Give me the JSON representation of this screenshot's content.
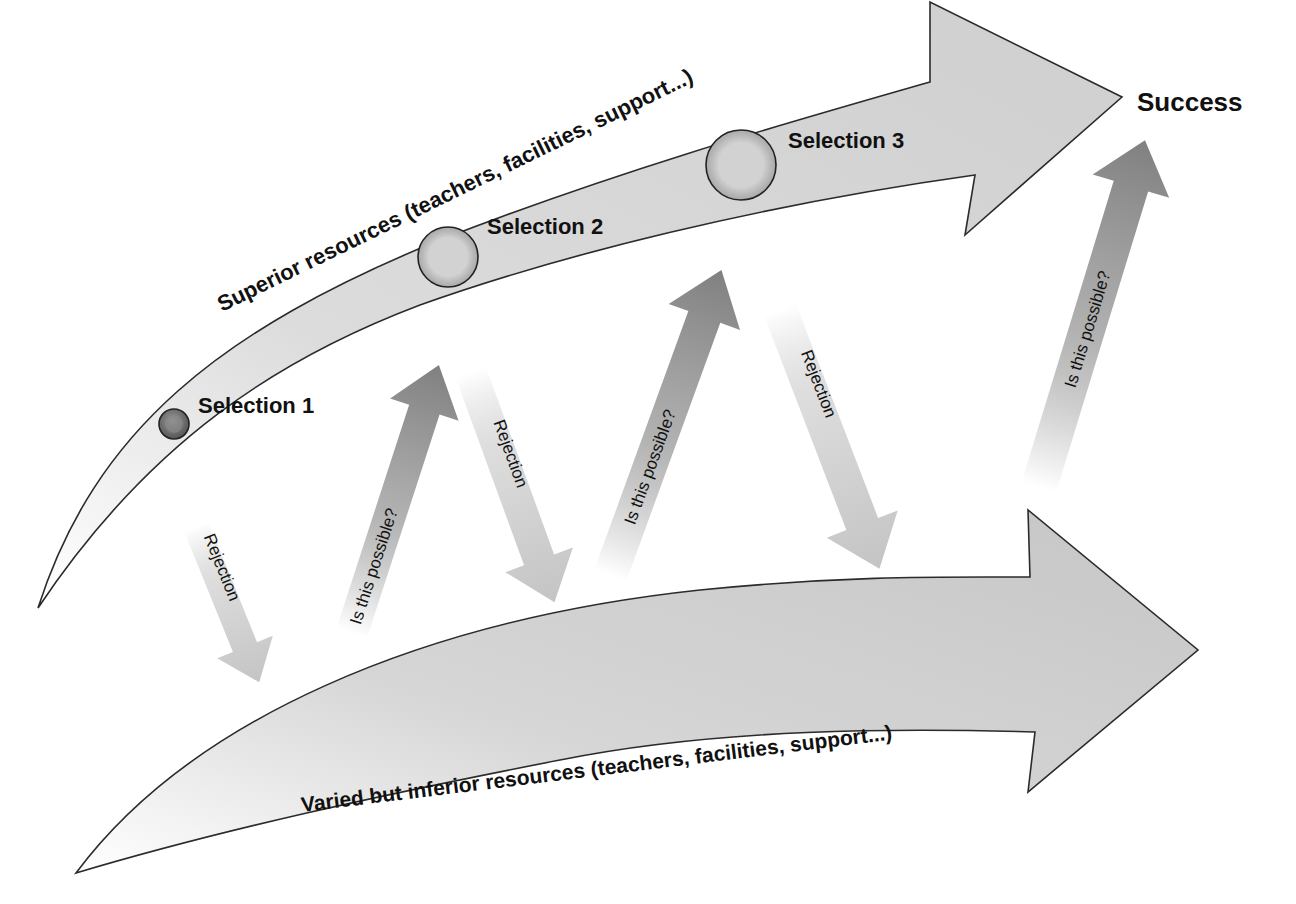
{
  "diagram": {
    "goal": {
      "label": "Success"
    },
    "upper_path": {
      "label": "Superior resources (teachers, facilities, support...)",
      "fill": "#d4d4d4",
      "stroke": "#333333"
    },
    "lower_path": {
      "label": "Varied but inferior resources (teachers, facilities, support...)",
      "fill": "#cfcfcf",
      "stroke": "#333333"
    },
    "selections": [
      {
        "label": "Selection 1"
      },
      {
        "label": "Selection 2"
      },
      {
        "label": "Selection 3"
      }
    ],
    "transitions": [
      {
        "type": "down",
        "label": "Rejection"
      },
      {
        "type": "up",
        "label": "Is this possible?"
      },
      {
        "type": "down",
        "label": "Rejection"
      },
      {
        "type": "up",
        "label": "Is this possible?"
      },
      {
        "type": "down",
        "label": "Rejection"
      },
      {
        "type": "up",
        "label": "Is this possible?"
      }
    ],
    "colors": {
      "up_arrow": "#8a8a8a",
      "down_arrow": "#c8c8c8",
      "text": "#111111"
    }
  }
}
